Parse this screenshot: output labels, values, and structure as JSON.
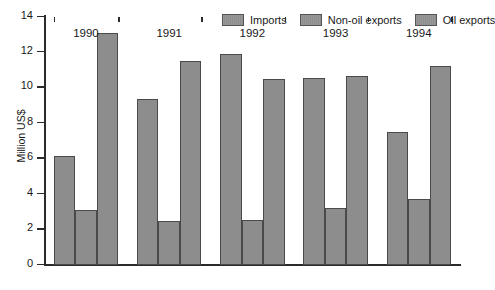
{
  "chart_data": {
    "type": "bar",
    "title": "",
    "subtitle": "",
    "xlabel": "",
    "ylabel": "Million US$",
    "categories": [
      "1990",
      "1991",
      "1992",
      "1993",
      "1994"
    ],
    "series": [
      {
        "name": "Imports",
        "values": [
          6.15,
          9.4,
          11.9,
          10.55,
          7.5
        ]
      },
      {
        "name": "Non-oil exports",
        "values": [
          3.1,
          2.5,
          2.55,
          3.2,
          3.75
        ]
      },
      {
        "name": "Oil exports",
        "values": [
          13.1,
          11.5,
          10.5,
          10.65,
          11.25
        ]
      }
    ],
    "ylim": [
      0,
      14
    ],
    "yticks": [
      0,
      2,
      4,
      6,
      8,
      10,
      12,
      14
    ],
    "ytick_labels": [
      "0",
      "2",
      "4",
      "6",
      "8",
      "10",
      "12",
      "14"
    ],
    "grid": false,
    "legend_position": "top-right",
    "bar_color": "#8d8d8d",
    "bar_border_color": "#4a4a4a",
    "axis_color": "#2b2b2b",
    "text_color": "#181818",
    "background": "#ffffff"
  },
  "legend": {
    "entries": [
      {
        "label": "Imports"
      },
      {
        "label": "Non-oil exports"
      },
      {
        "label": "Oil exports"
      }
    ]
  }
}
